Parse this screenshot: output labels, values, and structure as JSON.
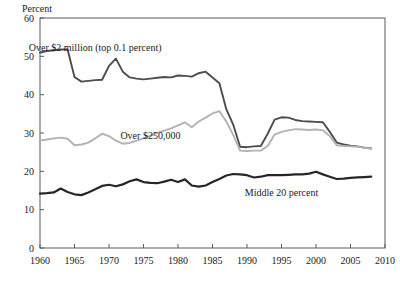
{
  "chart_data": {
    "type": "line",
    "title": "",
    "subtitle": "",
    "ylabel": "Percent",
    "xlabel": "",
    "ylim": [
      0,
      60
    ],
    "xlim": [
      1960,
      2010
    ],
    "grid": false,
    "legend_position": "inline-annotations",
    "y_ticks": [
      "0",
      "10",
      "20",
      "30",
      "40",
      "50",
      "60"
    ],
    "y_tick_values": [
      0,
      10,
      20,
      30,
      40,
      50,
      60
    ],
    "x_ticks": [
      "1960",
      "1965",
      "1970",
      "1975",
      "1980",
      "1985",
      "1990",
      "1995",
      "2000",
      "2005",
      "2010"
    ],
    "x_tick_values": [
      1960,
      1965,
      1970,
      1975,
      1980,
      1985,
      1990,
      1995,
      2000,
      2005,
      2010
    ],
    "x": [
      1960,
      1961,
      1962,
      1963,
      1964,
      1965,
      1966,
      1967,
      1968,
      1969,
      1970,
      1971,
      1972,
      1973,
      1974,
      1975,
      1976,
      1977,
      1978,
      1979,
      1980,
      1981,
      1982,
      1983,
      1984,
      1985,
      1986,
      1987,
      1988,
      1989,
      1990,
      1991,
      1992,
      1993,
      1994,
      1995,
      1996,
      1997,
      1998,
      1999,
      2000,
      2001,
      2002,
      2003,
      2004,
      2005,
      2006,
      2007,
      2008
    ],
    "series": [
      {
        "name": "Over $2 million (top 0.1 percent)",
        "color": "#4d4d4d",
        "width": 1.9,
        "label_x": 1968,
        "label_y": 51.5,
        "values": [
          51.0,
          51.4,
          51.6,
          51.8,
          51.8,
          44.6,
          43.4,
          43.6,
          43.8,
          43.9,
          47.5,
          49.4,
          46.0,
          44.5,
          44.2,
          44.0,
          44.2,
          44.4,
          44.6,
          44.5,
          45.0,
          44.9,
          44.7,
          45.6,
          46.0,
          44.5,
          43.0,
          36.2,
          32.2,
          26.4,
          26.3,
          26.5,
          26.6,
          29.8,
          33.5,
          34.1,
          34.0,
          33.4,
          33.1,
          33.0,
          32.9,
          32.8,
          30.3,
          27.5,
          27.0,
          26.7,
          26.5,
          26.2,
          26.0
        ]
      },
      {
        "name": "Over $250,000",
        "color": "#b3b3b3",
        "width": 1.9,
        "label_x": 1976,
        "label_y": 28.5,
        "values": [
          28.0,
          28.3,
          28.6,
          28.8,
          28.5,
          26.8,
          27.0,
          27.5,
          28.6,
          29.8,
          29.2,
          28.0,
          27.2,
          27.4,
          28.0,
          28.6,
          29.3,
          30.0,
          30.6,
          31.2,
          32.0,
          32.8,
          31.5,
          33.0,
          34.0,
          35.1,
          35.7,
          33.0,
          29.5,
          25.4,
          25.3,
          25.4,
          25.4,
          26.6,
          29.6,
          30.3,
          30.7,
          31.0,
          30.9,
          30.8,
          30.9,
          30.7,
          29.2,
          26.8,
          26.6,
          26.5,
          26.4,
          26.2,
          25.9
        ]
      },
      {
        "name": "Middle 20 percent",
        "color": "#262626",
        "width": 2.2,
        "label_x": 1995,
        "label_y": 13.6,
        "values": [
          14.2,
          14.3,
          14.5,
          15.5,
          14.6,
          14.0,
          13.8,
          14.5,
          15.3,
          16.2,
          16.5,
          16.1,
          16.6,
          17.4,
          17.9,
          17.2,
          17.0,
          16.9,
          17.3,
          17.8,
          17.2,
          17.9,
          16.3,
          16.0,
          16.3,
          17.2,
          18.0,
          18.9,
          19.3,
          19.2,
          19.0,
          18.4,
          18.6,
          19.0,
          19.0,
          19.0,
          19.1,
          19.2,
          19.2,
          19.4,
          19.9,
          19.2,
          18.6,
          18.0,
          18.1,
          18.3,
          18.4,
          18.5,
          18.6
        ]
      }
    ]
  }
}
